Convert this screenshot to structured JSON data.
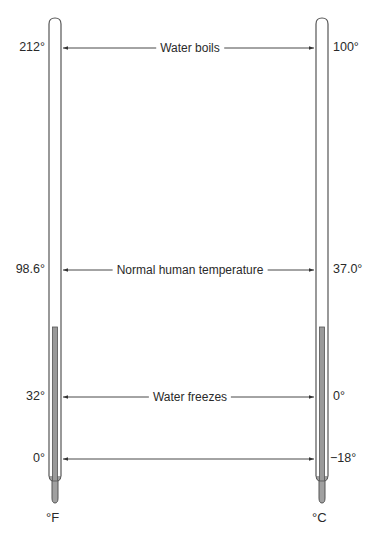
{
  "thermometers": {
    "left": {
      "unit": "°F",
      "labels": [
        "212°",
        "98.6°",
        "32°",
        "0°"
      ]
    },
    "right": {
      "unit": "°C",
      "labels": [
        "100°",
        "37.0°",
        "0°",
        "−18°"
      ]
    }
  },
  "reference_points": [
    {
      "name": "Water boils",
      "fahrenheit": "212°",
      "celsius": "100°"
    },
    {
      "name": "Normal human temperature",
      "fahrenheit": "98.6°",
      "celsius": "37.0°"
    },
    {
      "name": "Water freezes",
      "fahrenheit": "32°",
      "celsius": "0°"
    },
    {
      "name": "",
      "fahrenheit": "0°",
      "celsius": "−18°"
    }
  ],
  "colors": {
    "line": "#333333",
    "mercury": "#9a9a9a",
    "tube": "#555555"
  }
}
